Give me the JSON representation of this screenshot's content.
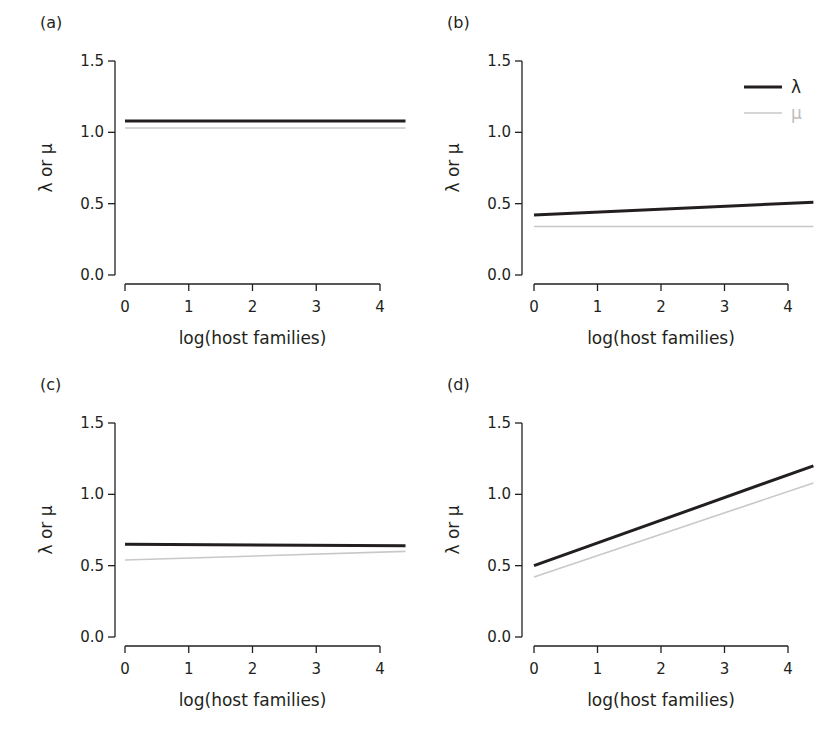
{
  "chart_data": [
    {
      "panel": "(a)",
      "type": "line",
      "xlabel": "log(host families)",
      "ylabel": "λ or μ",
      "xticks": [
        "0",
        "1",
        "2",
        "3",
        "4"
      ],
      "yticks": [
        "0.0",
        "0.5",
        "1.0",
        "1.5"
      ],
      "xlim": [
        0,
        4.4
      ],
      "ylim": [
        0,
        1.5
      ],
      "grid": false,
      "series": [
        {
          "name": "λ",
          "x": [
            0,
            4.4
          ],
          "values": [
            1.08,
            1.08
          ],
          "color": "#231f20"
        },
        {
          "name": "μ",
          "x": [
            0,
            4.4
          ],
          "values": [
            1.03,
            1.03
          ],
          "color": "#c8c8c8"
        }
      ]
    },
    {
      "panel": "(b)",
      "type": "line",
      "xlabel": "log(host families)",
      "ylabel": "λ or μ",
      "xticks": [
        "0",
        "1",
        "2",
        "3",
        "4"
      ],
      "yticks": [
        "0.0",
        "0.5",
        "1.0",
        "1.5"
      ],
      "xlim": [
        0,
        4.4
      ],
      "ylim": [
        0,
        1.5
      ],
      "grid": false,
      "legend": {
        "position": "top-right",
        "entries": [
          "λ",
          "μ"
        ]
      },
      "series": [
        {
          "name": "λ",
          "x": [
            0,
            4.4
          ],
          "values": [
            0.42,
            0.51
          ],
          "color": "#231f20"
        },
        {
          "name": "μ",
          "x": [
            0,
            4.4
          ],
          "values": [
            0.34,
            0.34
          ],
          "color": "#c8c8c8"
        }
      ]
    },
    {
      "panel": "(c)",
      "type": "line",
      "xlabel": "log(host families)",
      "ylabel": "λ or μ",
      "xticks": [
        "0",
        "1",
        "2",
        "3",
        "4"
      ],
      "yticks": [
        "0.0",
        "0.5",
        "1.0",
        "1.5"
      ],
      "xlim": [
        0,
        4.4
      ],
      "ylim": [
        0,
        1.5
      ],
      "grid": false,
      "series": [
        {
          "name": "λ",
          "x": [
            0,
            4.4
          ],
          "values": [
            0.65,
            0.64
          ],
          "color": "#231f20"
        },
        {
          "name": "μ",
          "x": [
            0,
            4.4
          ],
          "values": [
            0.54,
            0.6
          ],
          "color": "#c8c8c8"
        }
      ]
    },
    {
      "panel": "(d)",
      "type": "line",
      "xlabel": "log(host families)",
      "ylabel": "λ or μ",
      "xticks": [
        "0",
        "1",
        "2",
        "3",
        "4"
      ],
      "yticks": [
        "0.0",
        "0.5",
        "1.0",
        "1.5"
      ],
      "xlim": [
        0,
        4.4
      ],
      "ylim": [
        0,
        1.5
      ],
      "grid": false,
      "series": [
        {
          "name": "λ",
          "x": [
            0,
            4.4
          ],
          "values": [
            0.5,
            1.2
          ],
          "color": "#231f20"
        },
        {
          "name": "μ",
          "x": [
            0,
            4.4
          ],
          "values": [
            0.42,
            1.08
          ],
          "color": "#c8c8c8"
        }
      ]
    }
  ],
  "legend": {
    "lambda_label": "λ",
    "mu_label": "μ"
  }
}
